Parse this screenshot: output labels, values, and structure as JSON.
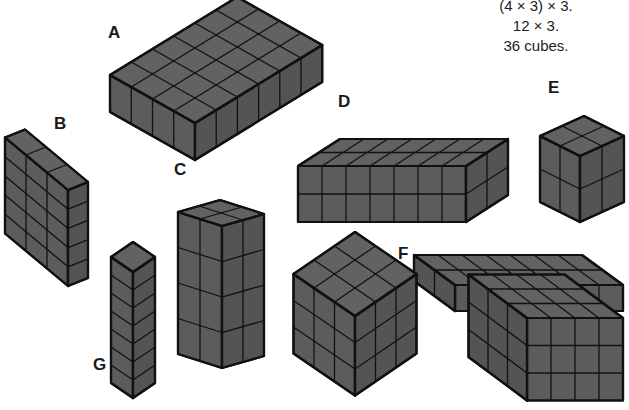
{
  "caption": {
    "lines": [
      "(4 × 3) × 3.",
      "12 × 3.",
      "36 cubes."
    ]
  },
  "style": {
    "fill": "#5c5c5c",
    "top_fill": "#626262",
    "side_fill": "#545454",
    "stroke": "#111111"
  },
  "shapes": [
    {
      "id": "A",
      "label": "A",
      "label_pos": [
        108,
        24
      ],
      "dims": {
        "left": 4,
        "right": 6,
        "height": 1
      },
      "front": [
        195,
        123
      ],
      "u": [
        -21.25,
        -12
      ],
      "v": [
        21.2,
        -13
      ],
      "h": [
        0,
        37
      ]
    },
    {
      "id": "B",
      "label": "B",
      "label_pos": [
        54,
        115
      ],
      "dims": {
        "left": 3,
        "right": 1,
        "height": 5
      },
      "front": [
        68,
        190
      ],
      "u": [
        -21,
        -17.5
      ],
      "v": [
        20,
        -8
      ],
      "h": [
        0,
        19.2
      ]
    },
    {
      "id": "C",
      "label": "C",
      "label_pos": [
        174,
        161
      ],
      "dims": {
        "left": 2,
        "right": 2,
        "height": 4
      },
      "front": [
        222,
        226
      ],
      "u": [
        -22,
        -7
      ],
      "v": [
        21,
        -6
      ],
      "h": [
        0,
        35.5
      ]
    },
    {
      "id": "D",
      "label": "D",
      "label_pos": [
        338,
        93
      ],
      "dims": {
        "left": 7,
        "right": 2,
        "height": 2
      },
      "front": [
        466,
        166
      ],
      "u": [
        -24,
        0
      ],
      "v": [
        21,
        -13.5
      ],
      "h": [
        0,
        28
      ]
    },
    {
      "id": "E",
      "label": "E",
      "label_pos": [
        548,
        79
      ],
      "dims": {
        "left": 2,
        "right": 2,
        "height": 2
      },
      "front": [
        580,
        156
      ],
      "u": [
        -20,
        -10
      ],
      "v": [
        22,
        -10
      ],
      "h": [
        0,
        33
      ]
    },
    {
      "id": "F",
      "label": "F",
      "label_pos": [
        398,
        245
      ],
      "dims": {
        "left": 7,
        "right": 2,
        "height": 1
      },
      "front": [
        455,
        285
      ],
      "u": [
        24,
        0
      ],
      "v": [
        -20.5,
        -15
      ],
      "h": [
        0,
        26
      ],
      "mirror": true
    },
    {
      "id": "G",
      "label": "G",
      "label_pos": [
        93,
        356
      ],
      "dims": {
        "left": 1,
        "right": 1,
        "height": 7
      },
      "front": [
        133,
        272
      ],
      "u": [
        -22,
        -15
      ],
      "v": [
        22,
        -15
      ],
      "h": [
        0,
        18
      ]
    },
    {
      "id": "H",
      "label": "H",
      "label_pos": [
        272,
        414
      ],
      "dims": {
        "left": 3,
        "right": 3,
        "height": 3
      },
      "front": [
        355,
        316
      ],
      "u": [
        -20.5,
        -14
      ],
      "v": [
        20.5,
        -14
      ],
      "h": [
        0,
        26.5
      ]
    },
    {
      "id": "I",
      "label": "I",
      "label_pos": [
        455,
        416
      ],
      "dims": {
        "left": 3,
        "right": 4,
        "height": 3
      },
      "front": [
        527,
        318
      ],
      "u": [
        -19.5,
        -14.5
      ],
      "v": [
        24,
        0
      ],
      "h": [
        0,
        27.5
      ],
      "box": true
    }
  ]
}
